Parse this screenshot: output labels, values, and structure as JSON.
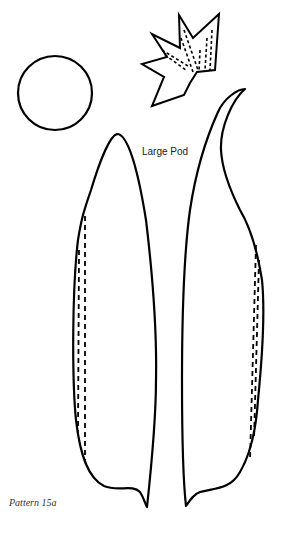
{
  "pattern": {
    "caption": "Pattern 15a",
    "pod_label": "Large Pod"
  },
  "colors": {
    "background": "#ffffff",
    "stroke": "#000000"
  },
  "pieces": [
    {
      "name": "circle-base",
      "shape": "circle"
    },
    {
      "name": "star-calyx",
      "shape": "star",
      "stitch_lines": "dashed"
    },
    {
      "name": "left-pod-half",
      "shape": "pod",
      "stitch_lines": "dashed, left edge"
    },
    {
      "name": "right-pod-half",
      "shape": "pod",
      "stitch_lines": "dashed, right edge"
    }
  ]
}
